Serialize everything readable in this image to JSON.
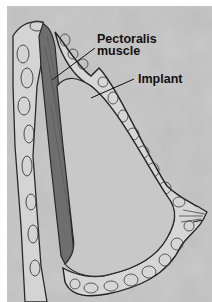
{
  "figure": {
    "labels": {
      "pectoralis_line1": "Pectoralis",
      "pectoralis_line2": "muscle",
      "implant": "Implant"
    },
    "colors": {
      "background": "#bdbdbd",
      "border": "#ffffff",
      "muscle": "#6e6e6e",
      "implant": "#c9c9c9",
      "tissue_outline": "#2a2a2a",
      "label_text": "#111111"
    }
  }
}
